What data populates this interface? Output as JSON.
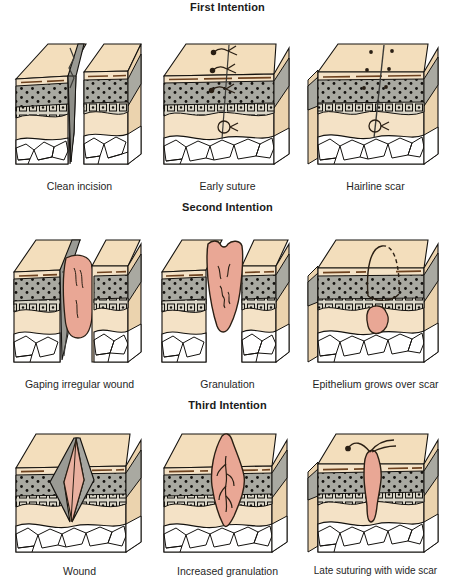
{
  "figure": {
    "title_visible": false,
    "type": "medical-illustration"
  },
  "palette": {
    "background": "#ffffff",
    "skin_top": "#F3DEBC",
    "skin_front": "#F4E2C6",
    "skin_side": "#EBD3AE",
    "dermis_gray": "#A9A9A1",
    "basal_layer": "#D6D2C4",
    "fat_white": "#FFFFFF",
    "granulation_pink": "#E9A795",
    "wound_gray": "#9A9A94",
    "outline": "#1a1a1a",
    "epidermis_line": "#7A4A22",
    "text": "#1f1f1f"
  },
  "sections": [
    {
      "id": "first-intention",
      "heading": "First Intention",
      "panels": [
        {
          "id": "clean-incision",
          "caption": "Clean incision",
          "marks": "deep clean vertical incision, separated skin block halves"
        },
        {
          "id": "early-suture",
          "caption": "Early suture",
          "marks": "three surface sutures and one deep suture loop",
          "suture_count": 3,
          "deep_suture_count": 1
        },
        {
          "id": "hairline-scar",
          "caption": "Hairline scar",
          "marks": "fine scar line with six suture point dots",
          "dot_count": 6,
          "deep_suture_count": 1
        }
      ]
    },
    {
      "id": "second-intention",
      "heading": "Second Intention",
      "panels": [
        {
          "id": "gaping-irregular-wound",
          "caption": "Gaping irregular wound",
          "marks": "wide open defect filled with pink tissue"
        },
        {
          "id": "granulation",
          "caption": "Granulation",
          "marks": "granulation tissue filling the defect"
        },
        {
          "id": "epithelium-grows-over-scar",
          "caption": "Epithelium grows over scar",
          "marks": "dome outline, partly dashed, over small buried pink scar"
        }
      ]
    },
    {
      "id": "third-intention",
      "heading": "Third Intention",
      "panels": [
        {
          "id": "wound",
          "caption": "Wound",
          "marks": "V-shaped open wound with gray walls and pink base"
        },
        {
          "id": "increased-granulation",
          "caption": "Increased granulation",
          "marks": "large diamond of granulation tissue with branching vessels"
        },
        {
          "id": "late-suturing-with-wide-scar",
          "caption": "Late suturing with wide scar",
          "marks": "wide pink scar column with surface suture",
          "suture_count": 1
        }
      ]
    }
  ],
  "layers": {
    "epidermis": "epidermis",
    "dermis": "dermis",
    "basal": "basal cell layer",
    "subcutaneous": "subcutaneous tissue",
    "adipose": "adipose / fat cells"
  }
}
